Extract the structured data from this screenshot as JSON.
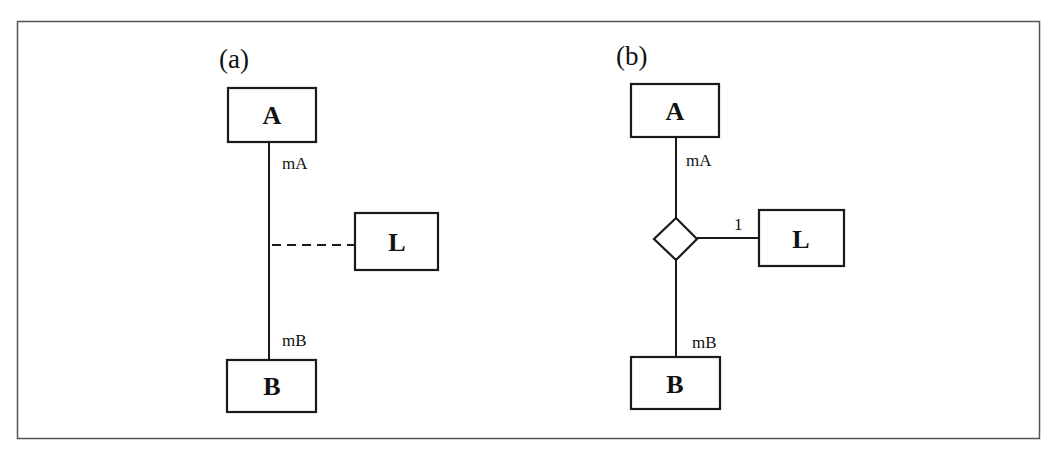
{
  "colors": {
    "stroke": "#1a1a1a",
    "frame": "#555555",
    "background": "#ffffff"
  },
  "panels": [
    {
      "id": "a",
      "label": "(a)",
      "entities": {
        "top": "A",
        "association": "L",
        "bottom": "B"
      },
      "multiplicities": {
        "top": "mA",
        "bottom": "mB"
      },
      "link_style": "dashed"
    },
    {
      "id": "b",
      "label": "(b)",
      "entities": {
        "top": "A",
        "association": "L",
        "bottom": "B"
      },
      "multiplicities": {
        "top": "mA",
        "bottom": "mB",
        "association": "1"
      },
      "link_style": "n-ary-diamond"
    }
  ]
}
